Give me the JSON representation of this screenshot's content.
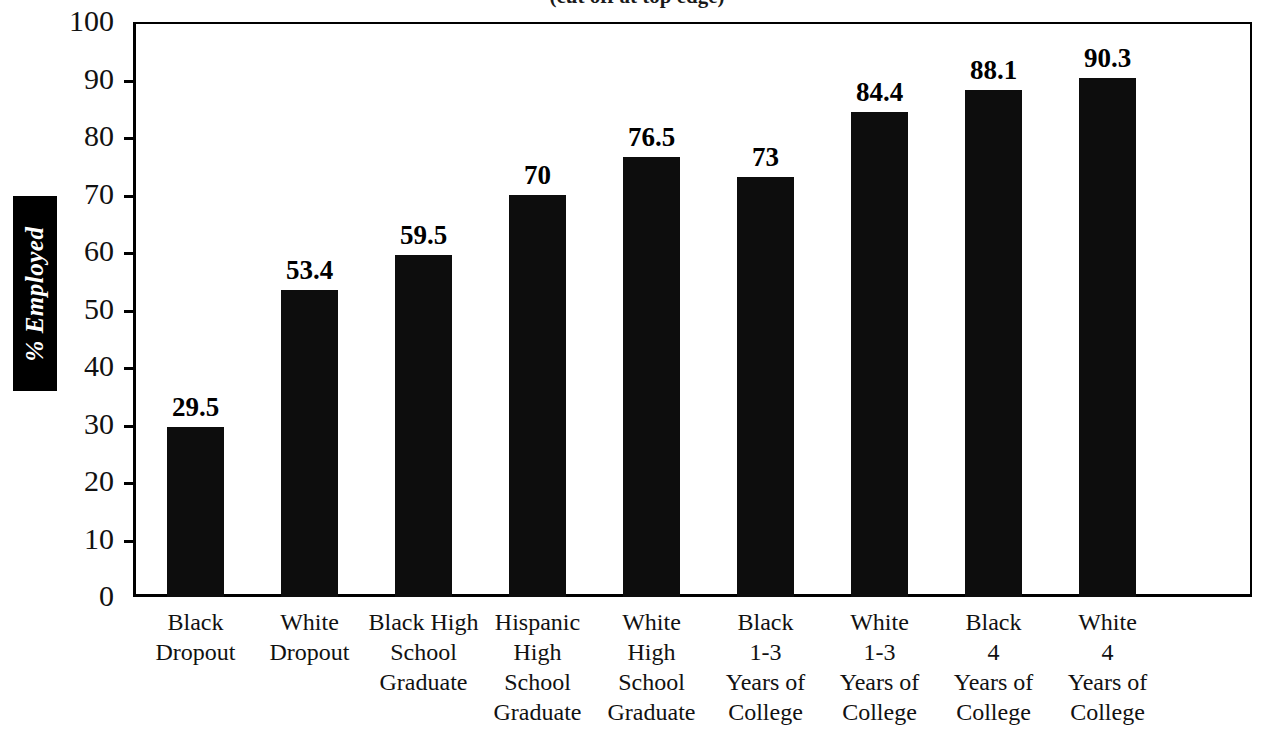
{
  "title_partial": "(cut off at top edge)",
  "axis": {
    "y_title": "% Employed",
    "y_ticks": [
      "100",
      "90",
      "80",
      "70",
      "60",
      "50",
      "40",
      "30",
      "20",
      "10",
      "0"
    ]
  },
  "chart_data": {
    "type": "bar",
    "title": "",
    "xlabel": "",
    "ylabel": "% Employed",
    "ylim": [
      0,
      100
    ],
    "ytick_step": 10,
    "grid": false,
    "legend": "none",
    "bar_color": "#0d0d0d",
    "categories": [
      "Black Dropout",
      "White Dropout",
      "Black High School Graduate",
      "Hispanic High School Graduate",
      "White High School Graduate",
      "Black 1-3 Years of College",
      "White 1-3 Years of College",
      "Black 4 Years of College",
      "White 4 Years of College"
    ],
    "category_lines": [
      [
        "Black",
        "Dropout"
      ],
      [
        "White",
        "Dropout"
      ],
      [
        "Black High",
        "School",
        "Graduate"
      ],
      [
        "Hispanic",
        "High",
        "School",
        "Graduate"
      ],
      [
        "White",
        "High",
        "School",
        "Graduate"
      ],
      [
        "Black",
        "1-3",
        "Years of",
        "College"
      ],
      [
        "White",
        "1-3",
        "Years of",
        "College"
      ],
      [
        "Black",
        "4",
        "Years of",
        "College"
      ],
      [
        "White",
        "4",
        "Years of",
        "College"
      ]
    ],
    "values": [
      29.5,
      53.4,
      59.5,
      70,
      76.5,
      73,
      84.4,
      88.1,
      90.3
    ],
    "value_labels": [
      "29.5",
      "53.4",
      "59.5",
      "70",
      "76.5",
      "73",
      "84.4",
      "88.1",
      "90.3"
    ]
  }
}
